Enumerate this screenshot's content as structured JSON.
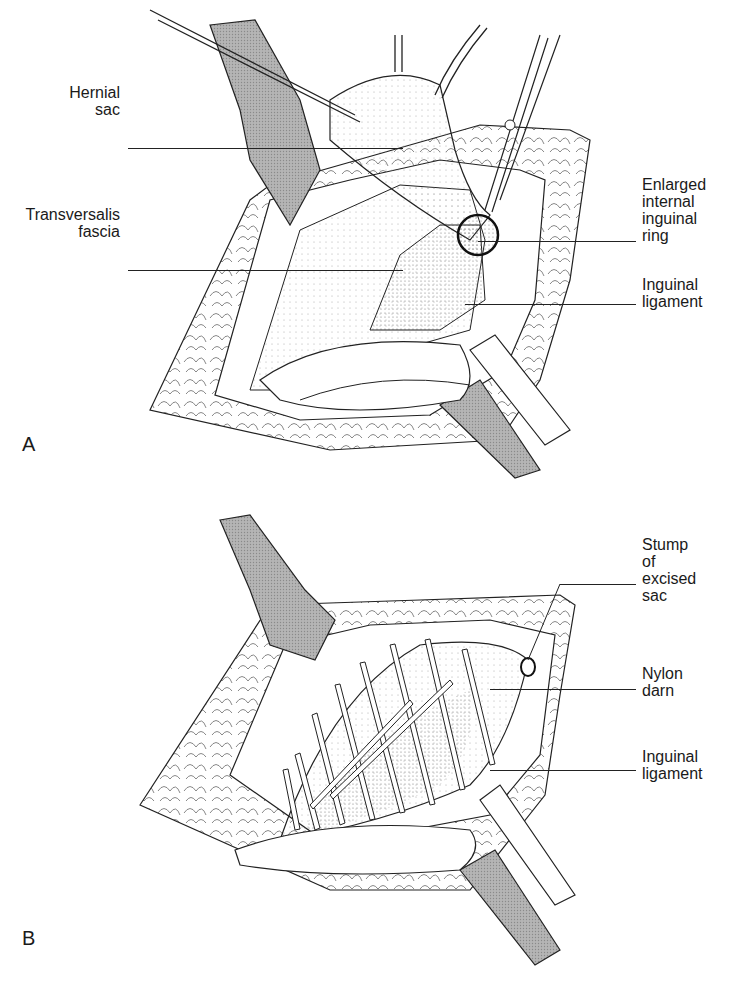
{
  "figure_a": {
    "panel_letter": "A",
    "labels": {
      "hernial_sac": {
        "line1": "Hernial",
        "line2": "sac"
      },
      "transversalis_fascia": {
        "line1": "Transversalis",
        "line2": "fascia"
      },
      "enlarged_ring": {
        "line1": "Enlarged",
        "line2": "internal",
        "line3": "inguinal",
        "line4": "ring"
      },
      "inguinal_ligament": {
        "line1": "Inguinal",
        "line2": "ligament"
      }
    }
  },
  "figure_b": {
    "panel_letter": "B",
    "labels": {
      "stump": {
        "line1": "Stump",
        "line2": "of",
        "line3": "excised",
        "line4": "sac"
      },
      "nylon_darn": {
        "line1": "Nylon",
        "line2": "darn"
      },
      "inguinal_ligament": {
        "line1": "Inguinal",
        "line2": "ligament"
      }
    }
  },
  "colors": {
    "ink": "#1a1a1a",
    "retractor_fill": "#9a9a9a",
    "paper": "#ffffff"
  }
}
